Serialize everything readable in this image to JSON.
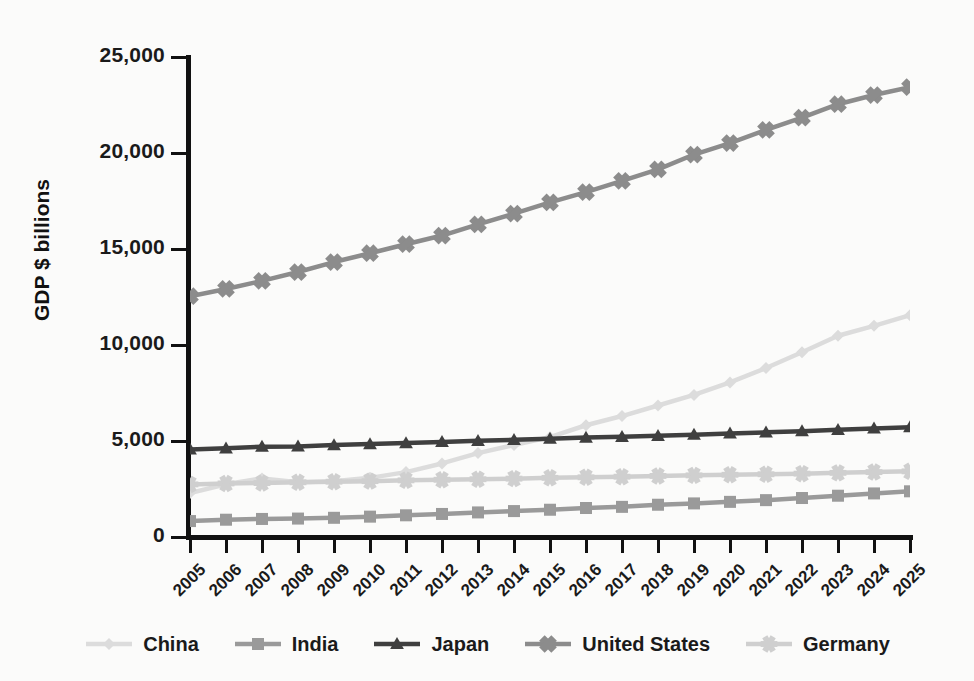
{
  "chart_data": {
    "type": "line",
    "title": "",
    "xlabel": "",
    "ylabel": "GDP $ billions",
    "xlim": [
      2005,
      2025
    ],
    "ylim": [
      0,
      25000
    ],
    "y_ticks": [
      0,
      5000,
      10000,
      15000,
      20000,
      25000
    ],
    "y_tick_labels": [
      "0",
      "5,000",
      "10,000",
      "15,000",
      "20,000",
      "25,000"
    ],
    "grid": false,
    "legend_position": "bottom",
    "categories": [
      2005,
      2006,
      2007,
      2008,
      2009,
      2010,
      2011,
      2012,
      2013,
      2014,
      2015,
      2016,
      2017,
      2018,
      2019,
      2020,
      2021,
      2022,
      2023,
      2024,
      2025
    ],
    "x_tick_labels": [
      "2005",
      "2006",
      "2007",
      "2008",
      "2009",
      "2010",
      "2011",
      "2012",
      "2013",
      "2014",
      "2015",
      "2016",
      "2017",
      "2018",
      "2019",
      "2020",
      "2021",
      "2022",
      "2023",
      "2024",
      "2025"
    ],
    "series": [
      {
        "name": "China",
        "color": "#dcdcdc",
        "marker": "diamond",
        "values": [
          2290,
          2750,
          3050,
          2850,
          2900,
          3080,
          3380,
          3830,
          4370,
          4790,
          5200,
          5820,
          6300,
          6850,
          7400,
          8050,
          8800,
          9620,
          10480,
          11000,
          11550
        ]
      },
      {
        "name": "India",
        "color": "#9a9a9a",
        "marker": "square",
        "values": [
          830,
          900,
          940,
          960,
          1000,
          1060,
          1130,
          1200,
          1280,
          1350,
          1420,
          1510,
          1570,
          1680,
          1750,
          1830,
          1920,
          2030,
          2150,
          2270,
          2380
        ]
      },
      {
        "name": "Japan",
        "color": "#3f3f3f",
        "marker": "triangle",
        "values": [
          4560,
          4620,
          4700,
          4720,
          4790,
          4840,
          4890,
          4950,
          5010,
          5060,
          5120,
          5180,
          5220,
          5270,
          5330,
          5390,
          5450,
          5510,
          5580,
          5650,
          5720
        ]
      },
      {
        "name": "United States",
        "color": "#8c8c8c",
        "marker": "x",
        "values": [
          12540,
          12920,
          13340,
          13800,
          14320,
          14780,
          15250,
          15700,
          16280,
          16840,
          17430,
          17960,
          18550,
          19150,
          19920,
          20520,
          21200,
          21840,
          22540,
          23020,
          23430
        ]
      },
      {
        "name": "Germany",
        "color": "#cfcfcf",
        "marker": "asterisk",
        "values": [
          2740,
          2790,
          2810,
          2850,
          2880,
          2910,
          2950,
          2980,
          3010,
          3040,
          3080,
          3110,
          3140,
          3180,
          3210,
          3240,
          3270,
          3300,
          3340,
          3380,
          3420
        ]
      }
    ]
  },
  "axis": {
    "y_title": "GDP $ billions"
  },
  "legend": {
    "items": [
      {
        "label": "China"
      },
      {
        "label": "India"
      },
      {
        "label": "Japan"
      },
      {
        "label": "United States"
      },
      {
        "label": "Germany"
      }
    ]
  }
}
